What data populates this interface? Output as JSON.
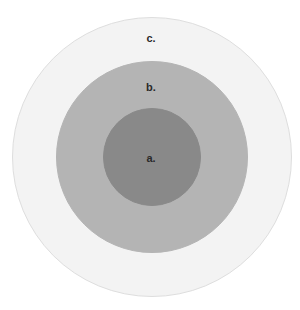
{
  "diagram": {
    "type": "nested-circles",
    "rings": [
      {
        "id": "c",
        "label": "c.",
        "color": "#f3f3f3",
        "border": "#dedede",
        "cx": 152,
        "cy": 157,
        "r": 140,
        "label_x": 151,
        "label_y": 38
      },
      {
        "id": "b",
        "label": "b.",
        "color": "#b4b4b4",
        "border": "#b4b4b4",
        "cx": 152,
        "cy": 157,
        "r": 96,
        "label_x": 151,
        "label_y": 87
      },
      {
        "id": "a",
        "label": "a.",
        "color": "#898989",
        "border": "#898989",
        "cx": 152,
        "cy": 157,
        "r": 49,
        "label_x": 151,
        "label_y": 158
      }
    ]
  }
}
